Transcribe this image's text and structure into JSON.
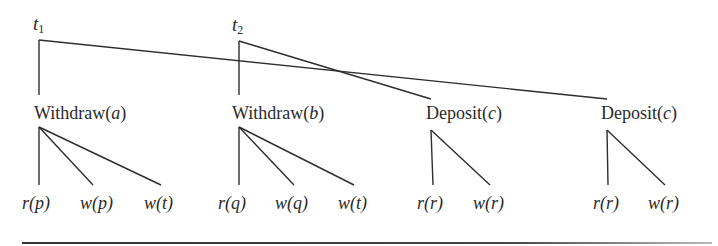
{
  "diagram": {
    "type": "transaction-tree",
    "roots": [
      {
        "id": "t1",
        "label": "t",
        "subscript": "1",
        "x": 39,
        "y": 40
      },
      {
        "id": "t2",
        "label": "t",
        "subscript": "2",
        "x": 239,
        "y": 41
      }
    ],
    "operations": [
      {
        "id": "op1",
        "name": "Withdraw",
        "arg": "a",
        "parent": "t1",
        "x": 39,
        "top": 95,
        "apex": 127
      },
      {
        "id": "op2",
        "name": "Withdraw",
        "arg": "b",
        "parent": "t2",
        "x": 239,
        "top": 95,
        "apex": 127
      },
      {
        "id": "op3",
        "name": "Deposit",
        "arg": "c",
        "parent": "t2",
        "x": 431,
        "top": 99,
        "apex": 130
      },
      {
        "id": "op4",
        "name": "Deposit",
        "arg": "c",
        "parent": "t1",
        "x": 607,
        "top": 99,
        "apex": 130
      }
    ],
    "leaves": [
      {
        "op": "op1",
        "fn": "r",
        "arg": "p",
        "x": 39
      },
      {
        "op": "op1",
        "fn": "w",
        "arg": "p",
        "x": 93
      },
      {
        "op": "op1",
        "fn": "w",
        "arg": "t",
        "x": 161
      },
      {
        "op": "op2",
        "fn": "r",
        "arg": "q",
        "x": 239
      },
      {
        "op": "op2",
        "fn": "w",
        "arg": "q",
        "x": 294
      },
      {
        "op": "op2",
        "fn": "w",
        "arg": "t",
        "x": 354
      },
      {
        "op": "op3",
        "fn": "r",
        "arg": "r",
        "x": 433
      },
      {
        "op": "op3",
        "fn": "w",
        "arg": "r",
        "x": 490
      },
      {
        "op": "op4",
        "fn": "r",
        "arg": "r",
        "x": 608
      },
      {
        "op": "op4",
        "fn": "w",
        "arg": "r",
        "x": 665
      }
    ],
    "leaf_line_bottom": 185,
    "line_color": "#2e2e2e"
  }
}
